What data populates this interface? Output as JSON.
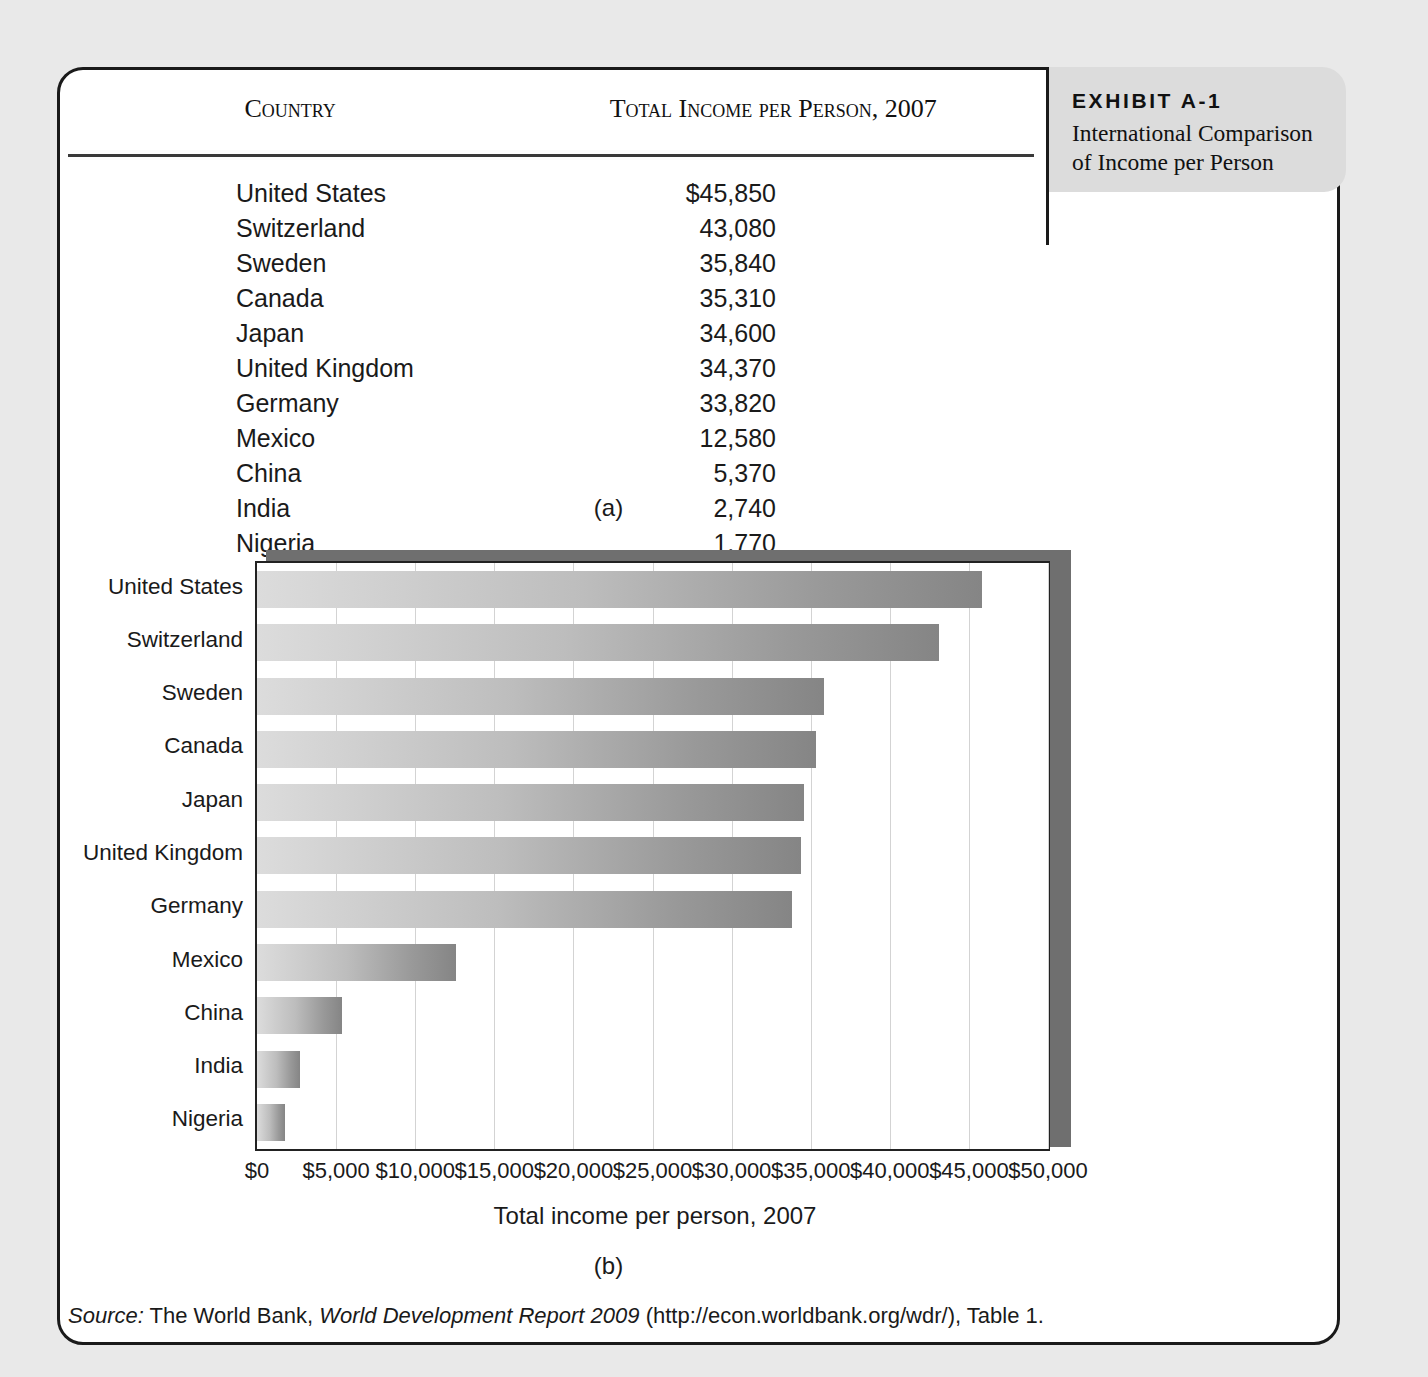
{
  "exhibit": {
    "number": "EXHIBIT A-1",
    "title": "International Comparison of Income per Person"
  },
  "table": {
    "headers": {
      "country": "Country",
      "income": "Total Income per Person, 2007"
    },
    "rows": [
      {
        "country": "United States",
        "income": "$45,850"
      },
      {
        "country": "Switzerland",
        "income": "43,080"
      },
      {
        "country": "Sweden",
        "income": "35,840"
      },
      {
        "country": "Canada",
        "income": "35,310"
      },
      {
        "country": "Japan",
        "income": "34,600"
      },
      {
        "country": "United Kingdom",
        "income": "34,370"
      },
      {
        "country": "Germany",
        "income": "33,820"
      },
      {
        "country": "Mexico",
        "income": "12,580"
      },
      {
        "country": "China",
        "income": "5,370"
      },
      {
        "country": "India",
        "income": "2,740"
      },
      {
        "country": "Nigeria",
        "income": "1,770"
      }
    ]
  },
  "labels": {
    "part_a": "(a)",
    "part_b": "(b)"
  },
  "source": {
    "prefix": "Source:",
    "publisher": "The World Bank,",
    "report": "World Development Report 2009",
    "suffix": "(http://econ.worldbank.org/wdr/), Table 1."
  },
  "chart_data": {
    "type": "bar",
    "orientation": "horizontal",
    "title": "",
    "xlabel": "Total income per person, 2007",
    "ylabel": "",
    "categories": [
      "United States",
      "Switzerland",
      "Sweden",
      "Canada",
      "Japan",
      "United Kingdom",
      "Germany",
      "Mexico",
      "China",
      "India",
      "Nigeria"
    ],
    "values": [
      45850,
      43080,
      35840,
      35310,
      34600,
      34370,
      33820,
      12580,
      5370,
      2740,
      1770
    ],
    "xlim": [
      0,
      50000
    ],
    "xticks": [
      0,
      5000,
      10000,
      15000,
      20000,
      25000,
      30000,
      35000,
      40000,
      45000,
      50000
    ],
    "xtick_labels": [
      "$0",
      "$5,000",
      "$10,000",
      "$15,000",
      "$20,000",
      "$25,000",
      "$30,000",
      "$35,000",
      "$40,000",
      "$45,000",
      "$50,000"
    ],
    "grid": true,
    "legend": false,
    "bar_color_start": "#dcdcdc",
    "bar_color_end": "#858585"
  }
}
